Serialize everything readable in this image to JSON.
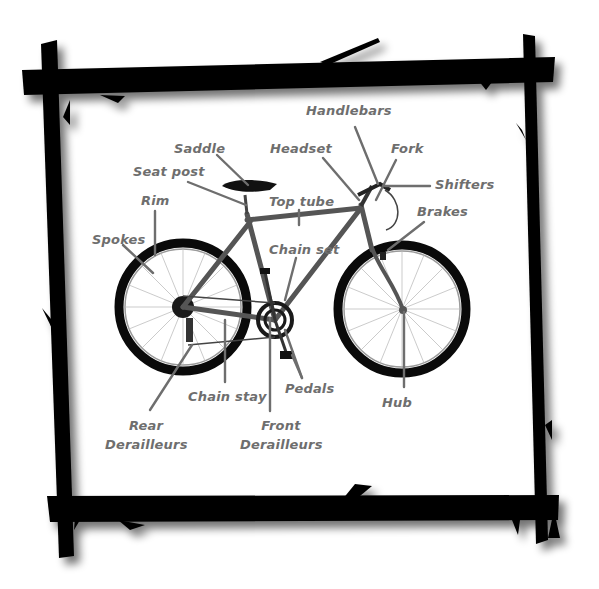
{
  "diagram": {
    "frame": "black rustic stick frame with drop shadow",
    "colors": {
      "background": "#ffffff",
      "frame": "#000000",
      "label_text": "#6e6e6e",
      "leader_lines": "#6e6e6e",
      "bike_frame": "#555555",
      "tires": "#0a0a0a"
    },
    "labels": {
      "handlebars": "Handlebars",
      "saddle": "Saddle",
      "headset": "Headset",
      "fork": "Fork",
      "seat_post": "Seat post",
      "shifters": "Shifters",
      "rim": "Rim",
      "top_tube": "Top tube",
      "brakes": "Brakes",
      "spokes": "Spokes",
      "chain_set": "Chain set",
      "pedals": "Pedals",
      "chain_stay": "Chain stay",
      "hub": "Hub",
      "rear_derailleurs_1": "Rear",
      "rear_derailleurs_2": "Derailleurs",
      "front_derailleurs_1": "Front",
      "front_derailleurs_2": "Derailleurs"
    }
  }
}
